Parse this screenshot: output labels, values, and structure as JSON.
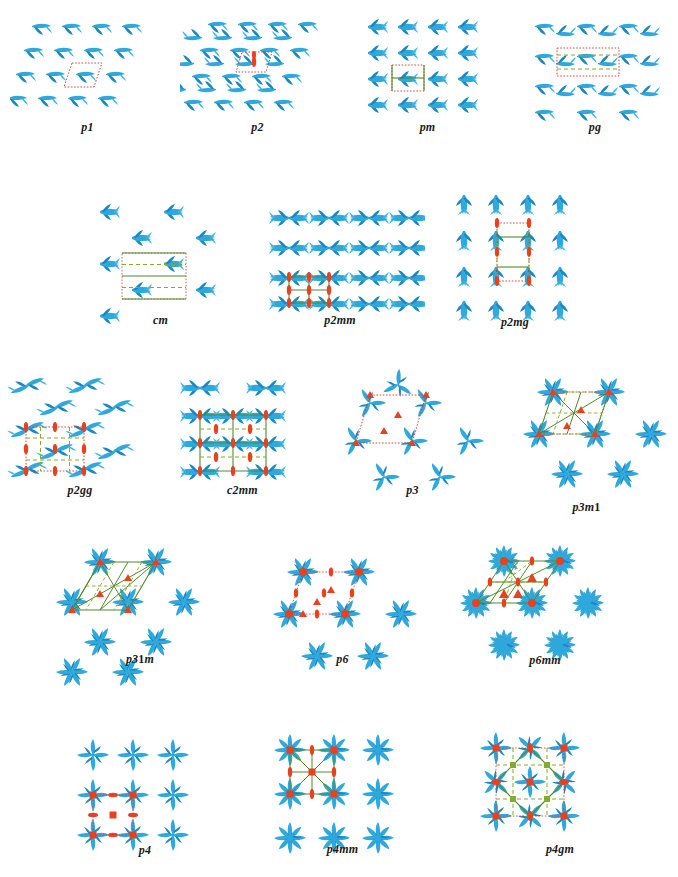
{
  "figure": {
    "background": "#ffffff",
    "colors": {
      "motif": "#2fa8dc",
      "motif_dark": "#1b86c2",
      "symmetry_element": "#e8411f",
      "mirror_line": "#4f8a2e",
      "glide_line": "#8aa82a",
      "unit_cell": "#cf3b2a",
      "label": "#1a1a1a"
    },
    "legend_symbols": {
      "lens": "two-fold rotation",
      "triangle": "three-fold rotation",
      "square": "four-fold rotation",
      "hexagon": "six-fold rotation",
      "solid-line": "mirror line",
      "dashed-line": "glide line",
      "dotted-box": "unit cell"
    },
    "rows": [
      {
        "row": 1,
        "groups": [
          "p1",
          "p2",
          "pm",
          "pg"
        ]
      },
      {
        "row": 2,
        "groups": [
          "cm",
          "p2mm",
          "p2mg"
        ]
      },
      {
        "row": 3,
        "groups": [
          "p2gg",
          "c2mm",
          "p3",
          "p3m1"
        ]
      },
      {
        "row": 4,
        "groups": [
          "p31m",
          "p6",
          "p6mm"
        ]
      },
      {
        "row": 5,
        "groups": [
          "p4",
          "p4mm",
          "p4gm"
        ]
      }
    ]
  },
  "panels": [
    {
      "id": "p1",
      "label_main": "p",
      "label_sub": "1",
      "lattice": "oblique",
      "order": 1,
      "caption": "p1"
    },
    {
      "id": "p2",
      "label_main": "p",
      "label_sub": "2",
      "lattice": "oblique",
      "order": 2,
      "caption": "p2"
    },
    {
      "id": "pm",
      "label_main": "p",
      "label_sub": "m",
      "lattice": "rectangular",
      "order": 3,
      "caption": "pm"
    },
    {
      "id": "pg",
      "label_main": "p",
      "label_sub": "g",
      "lattice": "rectangular",
      "order": 4,
      "caption": "pg"
    },
    {
      "id": "cm",
      "label_main": "c",
      "label_sub": "m",
      "lattice": "rhombic",
      "order": 5,
      "caption": "cm"
    },
    {
      "id": "p2mm",
      "label_main": "p",
      "label_sub": "2mm",
      "lattice": "rectangular",
      "order": 6,
      "caption": "p2mm"
    },
    {
      "id": "p2mg",
      "label_main": "p",
      "label_sub": "2mg",
      "lattice": "rectangular",
      "order": 7,
      "caption": "p2mg"
    },
    {
      "id": "p2gg",
      "label_main": "p",
      "label_sub": "2gg",
      "lattice": "rectangular",
      "order": 8,
      "caption": "p2gg"
    },
    {
      "id": "c2mm",
      "label_main": "c",
      "label_sub": "2mm",
      "lattice": "rhombic",
      "order": 9,
      "caption": "c2mm"
    },
    {
      "id": "p3",
      "label_main": "p",
      "label_sub": "3",
      "lattice": "hexagonal",
      "order": 10,
      "caption": "p3"
    },
    {
      "id": "p3m1",
      "label_main": "p",
      "label_sub": "3m1",
      "lattice": "hexagonal",
      "order": 11,
      "caption": "p3m1"
    },
    {
      "id": "p31m",
      "label_main": "p",
      "label_sub": "31m",
      "lattice": "hexagonal",
      "order": 12,
      "caption": "p31m"
    },
    {
      "id": "p6",
      "label_main": "p",
      "label_sub": "6",
      "lattice": "hexagonal",
      "order": 13,
      "caption": "p6"
    },
    {
      "id": "p6mm",
      "label_main": "p",
      "label_sub": "6mm",
      "lattice": "hexagonal",
      "order": 14,
      "caption": "p6mm"
    },
    {
      "id": "p4",
      "label_main": "p",
      "label_sub": "4",
      "lattice": "square",
      "order": 15,
      "caption": "p4"
    },
    {
      "id": "p4mm",
      "label_main": "p",
      "label_sub": "4mm",
      "lattice": "square",
      "order": 16,
      "caption": "p4mm"
    },
    {
      "id": "p4gm",
      "label_main": "p",
      "label_sub": "4gm",
      "lattice": "square",
      "order": 17,
      "caption": "p4gm"
    }
  ],
  "captions": {
    "p1": {
      "italic": "p1"
    },
    "p2": {
      "italic": "p2"
    },
    "pm": {
      "italic": "pm"
    },
    "pg": {
      "italic": "pg"
    },
    "cm": {
      "italic": "cm"
    },
    "p2mm": {
      "italic": "p2mm"
    },
    "p2mg": {
      "italic": "p2mg"
    },
    "p2gg": {
      "italic": "p2gg"
    },
    "c2mm": {
      "italic": "c2mm"
    },
    "p3": {
      "italic": "p3"
    },
    "p3m1": {
      "italic": "p3m",
      "upright": "1"
    },
    "p31m": {
      "italic": "p3",
      "upright": "1",
      "italic2": "m"
    },
    "p6": {
      "italic": "p6"
    },
    "p6mm": {
      "italic": "p6mm"
    },
    "p4": {
      "italic": "p4"
    },
    "p4mm": {
      "italic": "p4mm"
    },
    "p4gm": {
      "italic": "p4gm"
    }
  }
}
